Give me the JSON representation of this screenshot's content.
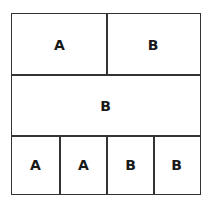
{
  "diagram": {
    "rows": [
      {
        "cells": [
          "A",
          "B"
        ]
      },
      {
        "cells": [
          "B"
        ]
      },
      {
        "cells": [
          "A",
          "A",
          "B",
          "B"
        ]
      }
    ]
  }
}
